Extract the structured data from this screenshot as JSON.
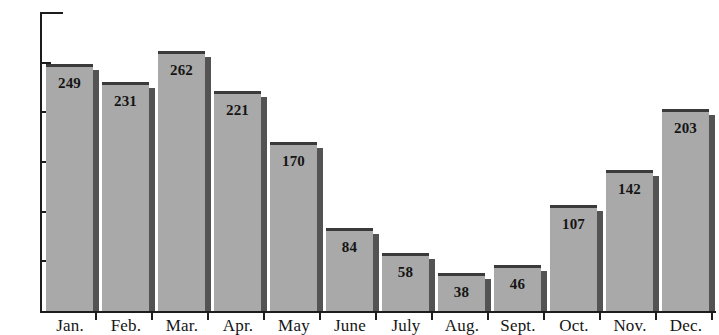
{
  "chart_data": {
    "type": "bar",
    "title": "",
    "subtitle": "",
    "xlabel": "",
    "ylabel": "",
    "categories": [
      "Jan.",
      "Feb.",
      "Mar.",
      "Apr.",
      "May",
      "June",
      "July",
      "Aug.",
      "Sept.",
      "Oct.",
      "Nov.",
      "Dec."
    ],
    "values": [
      249,
      231,
      262,
      221,
      170,
      84,
      58,
      38,
      46,
      107,
      142,
      203
    ],
    "value_labels": [
      "249",
      "231",
      "262",
      "221",
      "170",
      "84",
      "58",
      "38",
      "46",
      "107",
      "142",
      "203"
    ],
    "ylim": [
      0,
      300
    ],
    "ytick_values": [
      0,
      50,
      100,
      150,
      200,
      250,
      300
    ],
    "ytick_labels": [
      "0",
      "50",
      "100",
      "150",
      "200",
      "250",
      "300"
    ],
    "grid": false,
    "legend": null,
    "annotations": [],
    "style": {
      "bar_fill": "#a9a9a9",
      "bar_top_edge": "#3a3a3a",
      "bar_shadow": "#535353",
      "axis_color": "#1c1c1c",
      "text_color": "#151515",
      "background": "#ffffff"
    }
  }
}
